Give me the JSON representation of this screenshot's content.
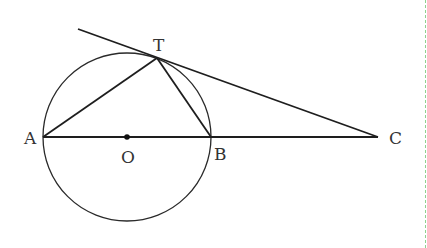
{
  "diagram": {
    "type": "geometry",
    "circle": {
      "center": "O",
      "cx": 127,
      "cy": 137,
      "r": 84
    },
    "points": {
      "A": {
        "label": "A",
        "x": 43,
        "y": 137
      },
      "O": {
        "label": "O",
        "x": 127,
        "y": 137
      },
      "B": {
        "label": "B",
        "x": 211,
        "y": 137
      },
      "C": {
        "label": "C",
        "x": 378,
        "y": 137
      },
      "T": {
        "label": "T",
        "x": 157,
        "y": 58
      }
    },
    "segments": [
      {
        "from": "A",
        "to": "C"
      },
      {
        "from": "A",
        "to": "T"
      },
      {
        "from": "T",
        "to": "B"
      },
      {
        "from": "tangent-start",
        "to": "C"
      }
    ],
    "tangent_start": {
      "x": 78,
      "y": 29
    },
    "stroke_color": "#222222",
    "divider_color": "#8fd18f"
  },
  "labels": {
    "A": "A",
    "O": "O",
    "B": "B",
    "C": "C",
    "T": "T"
  },
  "footer_partial_text": "……"
}
